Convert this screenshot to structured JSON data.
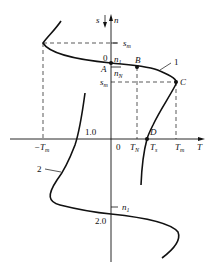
{
  "diagram": {
    "type": "motor mechanical characteristic (T-n / T-s curve)",
    "axes": {
      "horizontal": "T",
      "vertical_up_n": "n",
      "vertical_down_s": "s"
    },
    "labels": {
      "s_axis": "s",
      "n_axis": "n",
      "origin_top": "0",
      "origin_bottom": "0",
      "n1_top": "n",
      "n1_top_sub": "1",
      "nN": "n",
      "nN_sub": "N",
      "sm_top": "s",
      "sm_top_sub": "m",
      "sm_mid": "s",
      "sm_mid_sub": "m",
      "point_A": "A",
      "point_B": "B",
      "point_C": "C",
      "point_D": "D",
      "curve1": "1",
      "curve2": "2",
      "s_1_0": "1.0",
      "s_2_0": "2.0",
      "neg_Tm": "−T",
      "neg_Tm_sub": "m",
      "TN": "T",
      "TN_sub": "N",
      "Ts": "T",
      "Ts_sub": "s",
      "Tm": "T",
      "Tm_sub": "m",
      "T_axis": "T",
      "n1_bottom": "n",
      "n1_bottom_sub": "1"
    },
    "colors": {
      "line": "#111111",
      "background": "#ffffff"
    }
  }
}
